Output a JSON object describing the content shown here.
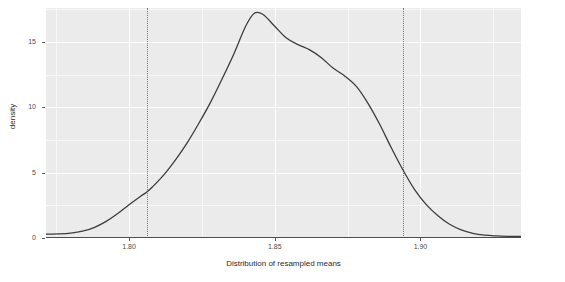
{
  "chart_data": {
    "type": "line",
    "title": "",
    "xlabel": "Distribution of resampled means",
    "ylabel": "density",
    "xlim": [
      1.7715,
      1.9345
    ],
    "ylim": [
      0,
      17.6
    ],
    "grid": true,
    "legend": "none",
    "x_ticks": [
      {
        "value": 1.8,
        "label": "1.80"
      },
      {
        "value": 1.85,
        "label": "1.85"
      },
      {
        "value": 1.9,
        "label": "1.90"
      }
    ],
    "y_ticks": [
      {
        "value": 0,
        "label": "0"
      },
      {
        "value": 5,
        "label": "5"
      },
      {
        "value": 10,
        "label": "10"
      },
      {
        "value": 15,
        "label": "15"
      }
    ],
    "series": [
      {
        "name": "density",
        "color": "#3d3d3d",
        "x": [
          1.7715,
          1.776,
          1.78,
          1.784,
          1.788,
          1.792,
          1.796,
          1.8,
          1.804,
          1.806,
          1.808,
          1.812,
          1.816,
          1.82,
          1.824,
          1.828,
          1.832,
          1.836,
          1.84,
          1.843,
          1.846,
          1.85,
          1.854,
          1.858,
          1.862,
          1.866,
          1.87,
          1.874,
          1.878,
          1.882,
          1.886,
          1.89,
          1.894,
          1.898,
          1.902,
          1.906,
          1.91,
          1.914,
          1.918,
          1.922,
          1.926,
          1.93,
          1.9345
        ],
        "y": [
          0.3,
          0.32,
          0.38,
          0.52,
          0.8,
          1.25,
          1.85,
          2.55,
          3.2,
          3.5,
          3.9,
          4.85,
          6.0,
          7.3,
          8.8,
          10.4,
          12.2,
          14.1,
          16.2,
          17.2,
          17.1,
          16.2,
          15.3,
          14.8,
          14.4,
          13.8,
          13.0,
          12.4,
          11.6,
          10.3,
          8.7,
          6.9,
          5.2,
          3.7,
          2.55,
          1.7,
          1.05,
          0.62,
          0.36,
          0.22,
          0.16,
          0.13,
          0.12
        ]
      }
    ],
    "annotations": {
      "vertical_lines": [
        {
          "name": "lower-confidence-bound",
          "x": 1.806,
          "style": "dotted",
          "color": "#7a7a7a"
        },
        {
          "name": "upper-confidence-bound",
          "x": 1.894,
          "style": "dotted",
          "color": "#7a7a7a"
        }
      ]
    },
    "panel_background": "#ebebeb",
    "gridline_color": "#ffffff",
    "axis_color": "#4d4d4d"
  }
}
